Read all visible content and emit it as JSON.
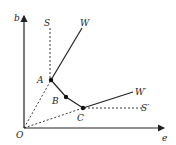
{
  "diagram": {
    "axes": {
      "y_label": "b",
      "x_label": "e",
      "origin_label": "O"
    },
    "points": {
      "A": "A",
      "B": "B",
      "C": "C"
    },
    "lines": {
      "S": "S",
      "W": "W",
      "W_prime": "W′",
      "S_prime": "S′"
    },
    "colors": {
      "ink": "#222222",
      "background": "#ffffff"
    }
  }
}
